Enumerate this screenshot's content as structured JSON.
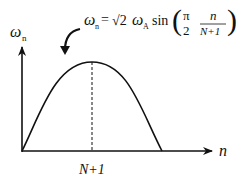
{
  "diagram": {
    "type": "dispersion-curve",
    "y_axis_label": {
      "symbol": "ω",
      "subscript": "n"
    },
    "x_axis_label": "n",
    "peak_tick_label": "N+1",
    "formula": {
      "lhs_symbol": "ω",
      "lhs_subscript": "n",
      "equals": "=",
      "sqrt_symbol": "√2",
      "omega": "ω",
      "omega_subscript": "A",
      "func": "sin",
      "frac1_num": "π",
      "frac1_den": "2",
      "frac2_num": "n",
      "frac2_den": "N+1"
    },
    "colors": {
      "stroke": "#111111",
      "background": "#ffffff"
    }
  }
}
